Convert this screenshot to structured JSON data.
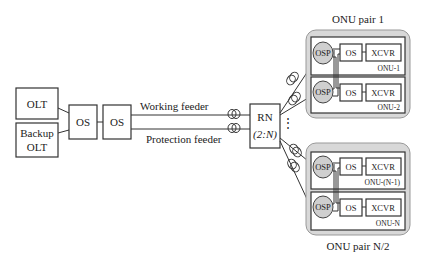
{
  "diagram": {
    "olt": {
      "label": "OLT"
    },
    "backup_olt": {
      "line1": "Backup",
      "line2": "OLT"
    },
    "os_switch_1": {
      "label": "OS"
    },
    "os_switch_2": {
      "label": "OS"
    },
    "working_feeder": {
      "label": "Working feeder"
    },
    "protection_feeder": {
      "label": "Protection feeder"
    },
    "rn": {
      "line1": "RN",
      "line2": "(2:N)"
    },
    "ellipsis": "⋮",
    "onu_pair_1": {
      "title": "ONU pair 1",
      "onus": [
        {
          "osp": "OSP",
          "os": "OS",
          "xcvr": "XCVR",
          "name": "ONU-1"
        },
        {
          "osp": "OSP",
          "os": "OS",
          "xcvr": "XCVR",
          "name": "ONU-2"
        }
      ]
    },
    "onu_pair_n2": {
      "title": "ONU pair N/2",
      "onus": [
        {
          "osp": "OSP",
          "os": "OS",
          "xcvr": "XCVR",
          "name": "ONU-(N-1)"
        },
        {
          "osp": "OSP",
          "os": "OS",
          "xcvr": "XCVR",
          "name": "ONU-N"
        }
      ]
    },
    "colors": {
      "pair_fill": "#d8d8d8",
      "osp_fill": "#cfcfcf",
      "stroke": "#333333"
    }
  }
}
